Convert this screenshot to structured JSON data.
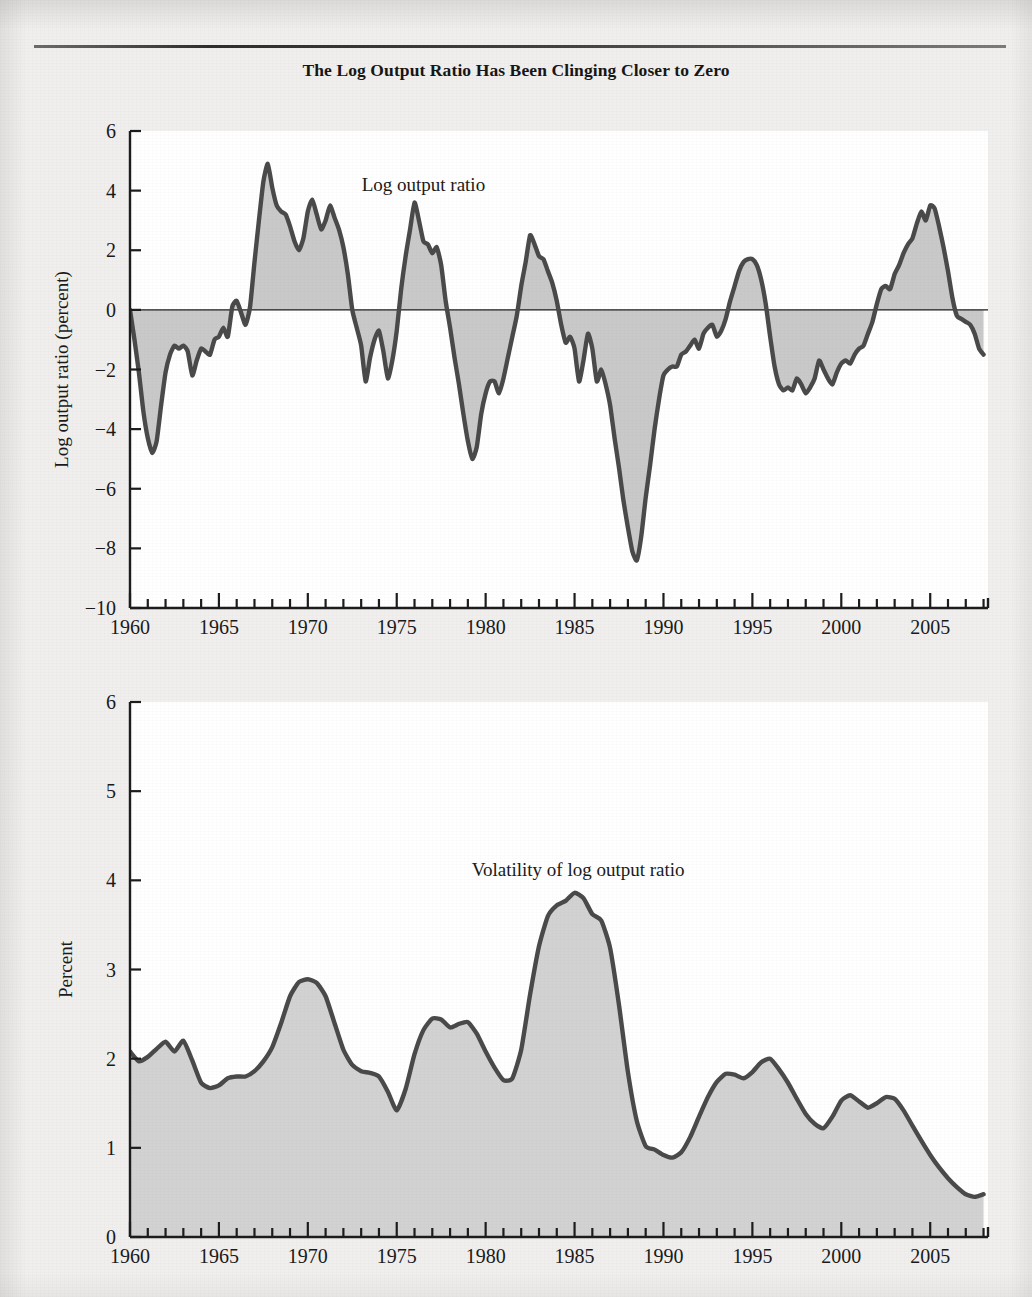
{
  "title": "The Log Output Ratio Has Been Clinging Closer to Zero",
  "page": {
    "background_color": "#f0efee",
    "plot_background_color": "#ffffff",
    "rule_color": "#3a3836"
  },
  "chart_data": [
    {
      "id": "log-output-ratio",
      "type": "area",
      "title": "The Log Output Ratio Has Been Clinging Closer to Zero",
      "series_label": "Log output ratio",
      "xlabel": "",
      "ylabel": "Log output ratio (percent)",
      "xlim": [
        1960,
        2008.25
      ],
      "ylim": [
        -10,
        6
      ],
      "yticks": [
        -10,
        -8,
        -6,
        -4,
        -2,
        0,
        2,
        4,
        6
      ],
      "ytick_labels": [
        "-10",
        "-8",
        "-6",
        "-4",
        "-2",
        "0",
        "2",
        "4",
        "6"
      ],
      "xticks": [
        1960,
        1965,
        1970,
        1975,
        1980,
        1985,
        1990,
        1995,
        2000,
        2005
      ],
      "xtick_labels": [
        "1960",
        "1965",
        "1970",
        "1975",
        "1980",
        "1985",
        "1990",
        "1995",
        "2000",
        "2005"
      ],
      "minor_xtick_interval": 1,
      "grid": false,
      "legend": "none",
      "zero_line": true,
      "line_color": "#4a4a4a",
      "fill_color": "#c9c9c9",
      "baseline": 0,
      "x": [
        1960.0,
        1960.25,
        1960.5,
        1960.75,
        1961.0,
        1961.25,
        1961.5,
        1961.75,
        1962.0,
        1962.25,
        1962.5,
        1962.75,
        1963.0,
        1963.25,
        1963.5,
        1963.75,
        1964.0,
        1964.25,
        1964.5,
        1964.75,
        1965.0,
        1965.25,
        1965.5,
        1965.75,
        1966.0,
        1966.25,
        1966.5,
        1966.75,
        1967.0,
        1967.25,
        1967.5,
        1967.75,
        1968.0,
        1968.25,
        1968.5,
        1968.75,
        1969.0,
        1969.25,
        1969.5,
        1969.75,
        1970.0,
        1970.25,
        1970.5,
        1970.75,
        1971.0,
        1971.25,
        1971.5,
        1971.75,
        1972.0,
        1972.25,
        1972.5,
        1972.75,
        1973.0,
        1973.25,
        1973.5,
        1973.75,
        1974.0,
        1974.25,
        1974.5,
        1974.75,
        1975.0,
        1975.25,
        1975.5,
        1975.75,
        1976.0,
        1976.25,
        1976.5,
        1976.75,
        1977.0,
        1977.25,
        1977.5,
        1977.75,
        1978.0,
        1978.25,
        1978.5,
        1978.75,
        1979.0,
        1979.25,
        1979.5,
        1979.75,
        1980.0,
        1980.25,
        1980.5,
        1980.75,
        1981.0,
        1981.25,
        1981.5,
        1981.75,
        1982.0,
        1982.25,
        1982.5,
        1982.75,
        1983.0,
        1983.25,
        1983.5,
        1983.75,
        1984.0,
        1984.25,
        1984.5,
        1984.75,
        1985.0,
        1985.25,
        1985.5,
        1985.75,
        1986.0,
        1986.25,
        1986.5,
        1986.75,
        1987.0,
        1987.25,
        1987.5,
        1987.75,
        1988.0,
        1988.25,
        1988.5,
        1988.75,
        1989.0,
        1989.25,
        1989.5,
        1989.75,
        1990.0,
        1990.25,
        1990.5,
        1990.75,
        1991.0,
        1991.25,
        1991.5,
        1991.75,
        1992.0,
        1992.25,
        1992.5,
        1992.75,
        1993.0,
        1993.25,
        1993.5,
        1993.75,
        1994.0,
        1994.25,
        1994.5,
        1994.75,
        1995.0,
        1995.25,
        1995.5,
        1995.75,
        1996.0,
        1996.25,
        1996.5,
        1996.75,
        1997.0,
        1997.25,
        1997.5,
        1997.75,
        1998.0,
        1998.25,
        1998.5,
        1998.75,
        1999.0,
        1999.25,
        1999.5,
        1999.75,
        2000.0,
        2000.25,
        2000.5,
        2000.75,
        2001.0,
        2001.25,
        2001.5,
        2001.75,
        2002.0,
        2002.25,
        2002.5,
        2002.75,
        2003.0,
        2003.25,
        2003.5,
        2003.75,
        2004.0,
        2004.25,
        2004.5,
        2004.75,
        2005.0,
        2005.25,
        2005.5,
        2005.75,
        2006.0,
        2006.25,
        2006.5,
        2006.75,
        2007.0,
        2007.25,
        2007.5,
        2007.75,
        2008.0
      ],
      "y": [
        0.0,
        -1.0,
        -2.1,
        -3.4,
        -4.3,
        -4.8,
        -4.4,
        -3.2,
        -2.1,
        -1.5,
        -1.2,
        -1.3,
        -1.2,
        -1.4,
        -2.2,
        -1.7,
        -1.3,
        -1.4,
        -1.5,
        -1.0,
        -0.9,
        -0.6,
        -0.9,
        0.1,
        0.3,
        -0.1,
        -0.5,
        0.1,
        1.6,
        3.0,
        4.3,
        4.9,
        4.1,
        3.5,
        3.3,
        3.2,
        2.8,
        2.3,
        2.0,
        2.4,
        3.3,
        3.7,
        3.2,
        2.7,
        3.0,
        3.5,
        3.1,
        2.7,
        2.1,
        1.2,
        0.0,
        -0.6,
        -1.2,
        -2.4,
        -1.6,
        -1.0,
        -0.7,
        -1.4,
        -2.3,
        -1.7,
        -0.7,
        0.7,
        1.8,
        2.7,
        3.6,
        3.0,
        2.3,
        2.2,
        1.9,
        2.1,
        1.5,
        0.3,
        -0.6,
        -1.6,
        -2.5,
        -3.5,
        -4.4,
        -5.0,
        -4.6,
        -3.5,
        -2.8,
        -2.4,
        -2.4,
        -2.8,
        -2.3,
        -1.6,
        -0.9,
        -0.2,
        0.8,
        1.6,
        2.5,
        2.2,
        1.8,
        1.7,
        1.3,
        0.9,
        0.3,
        -0.5,
        -1.1,
        -0.9,
        -1.3,
        -2.4,
        -1.7,
        -0.8,
        -1.3,
        -2.4,
        -2.0,
        -2.5,
        -3.2,
        -4.3,
        -5.3,
        -6.4,
        -7.3,
        -8.1,
        -8.4,
        -7.6,
        -6.3,
        -5.2,
        -4.0,
        -3.0,
        -2.2,
        -2.0,
        -1.9,
        -1.9,
        -1.5,
        -1.4,
        -1.2,
        -1.0,
        -1.3,
        -0.8,
        -0.6,
        -0.5,
        -0.9,
        -0.7,
        -0.3,
        0.3,
        0.8,
        1.3,
        1.6,
        1.7,
        1.7,
        1.5,
        1.0,
        0.2,
        -0.9,
        -1.9,
        -2.5,
        -2.7,
        -2.6,
        -2.7,
        -2.3,
        -2.5,
        -2.8,
        -2.6,
        -2.3,
        -1.7,
        -2.0,
        -2.3,
        -2.5,
        -2.1,
        -1.8,
        -1.7,
        -1.8,
        -1.5,
        -1.3,
        -1.2,
        -0.8,
        -0.4,
        0.2,
        0.7,
        0.8,
        0.7,
        1.2,
        1.5,
        1.9,
        2.2,
        2.4,
        2.9,
        3.3,
        3.0,
        3.5,
        3.4,
        2.8,
        2.1,
        1.3,
        0.4,
        -0.2,
        -0.3,
        -0.4,
        -0.5,
        -0.8,
        -1.3,
        -1.5,
        -1.3,
        -0.9,
        -0.5,
        -0.3,
        -0.2,
        0.1,
        0.4,
        0.2,
        0.6,
        0.7,
        0.5,
        0.2,
        -0.3,
        0.0,
        0.5,
        0.2,
        -0.4,
        -0.1,
        0.2,
        -0.3
      ],
      "annotation": {
        "text": "Log output ratio",
        "x": 1976.5,
        "y": 4.0
      }
    },
    {
      "id": "volatility-of-log-output-ratio",
      "type": "area",
      "title": "",
      "series_label": "Volatility of log output ratio",
      "xlabel": "",
      "ylabel": "Percent",
      "xlim": [
        1960,
        2008.25
      ],
      "ylim": [
        0,
        6
      ],
      "yticks": [
        0,
        1,
        2,
        3,
        4,
        5,
        6
      ],
      "ytick_labels": [
        "0",
        "1",
        "2",
        "3",
        "4",
        "5",
        "6"
      ],
      "xticks": [
        1960,
        1965,
        1970,
        1975,
        1980,
        1985,
        1990,
        1995,
        2000,
        2005
      ],
      "xtick_labels": [
        "1960",
        "1965",
        "1970",
        "1975",
        "1980",
        "1985",
        "1990",
        "1995",
        "2000",
        "2005"
      ],
      "minor_xtick_interval": 1,
      "grid": false,
      "legend": "none",
      "zero_line": false,
      "line_color": "#4a4a4a",
      "fill_color": "#d2d2d2",
      "baseline": 0,
      "x": [
        1960.0,
        1960.5,
        1961.0,
        1961.5,
        1962.0,
        1962.5,
        1963.0,
        1963.5,
        1964.0,
        1964.5,
        1965.0,
        1965.5,
        1966.0,
        1966.5,
        1967.0,
        1967.5,
        1968.0,
        1968.5,
        1969.0,
        1969.5,
        1970.0,
        1970.5,
        1971.0,
        1971.5,
        1972.0,
        1972.5,
        1973.0,
        1973.5,
        1974.0,
        1974.5,
        1975.0,
        1975.5,
        1976.0,
        1976.5,
        1977.0,
        1977.5,
        1978.0,
        1978.5,
        1979.0,
        1979.5,
        1980.0,
        1980.5,
        1981.0,
        1981.5,
        1982.0,
        1982.5,
        1983.0,
        1983.5,
        1984.0,
        1984.5,
        1985.0,
        1985.5,
        1986.0,
        1986.5,
        1987.0,
        1987.5,
        1988.0,
        1988.5,
        1989.0,
        1989.5,
        1990.0,
        1990.5,
        1991.0,
        1991.5,
        1992.0,
        1992.5,
        1993.0,
        1993.5,
        1994.0,
        1994.5,
        1995.0,
        1995.5,
        1996.0,
        1996.5,
        1997.0,
        1997.5,
        1998.0,
        1998.5,
        1999.0,
        1999.5,
        2000.0,
        2000.5,
        2001.0,
        2001.5,
        2002.0,
        2002.5,
        2003.0,
        2003.5,
        2004.0,
        2004.5,
        2005.0,
        2005.5,
        2006.0,
        2006.5,
        2007.0,
        2007.5,
        2008.0
      ],
      "y": [
        2.08,
        1.97,
        2.02,
        2.11,
        2.19,
        2.08,
        2.2,
        1.98,
        1.73,
        1.67,
        1.7,
        1.78,
        1.8,
        1.8,
        1.86,
        1.97,
        2.13,
        2.4,
        2.7,
        2.86,
        2.89,
        2.85,
        2.7,
        2.4,
        2.1,
        1.93,
        1.86,
        1.84,
        1.8,
        1.63,
        1.42,
        1.66,
        2.05,
        2.32,
        2.45,
        2.44,
        2.35,
        2.39,
        2.41,
        2.28,
        2.08,
        1.9,
        1.76,
        1.78,
        2.1,
        2.72,
        3.26,
        3.6,
        3.72,
        3.77,
        3.86,
        3.8,
        3.62,
        3.55,
        3.24,
        2.6,
        1.85,
        1.3,
        1.02,
        0.98,
        0.92,
        0.89,
        0.95,
        1.12,
        1.35,
        1.57,
        1.74,
        1.83,
        1.82,
        1.78,
        1.85,
        1.96,
        2.0,
        1.88,
        1.73,
        1.55,
        1.38,
        1.27,
        1.22,
        1.35,
        1.53,
        1.59,
        1.52,
        1.45,
        1.5,
        1.57,
        1.55,
        1.42,
        1.25,
        1.08,
        0.92,
        0.78,
        0.66,
        0.56,
        0.48,
        0.45,
        0.48
      ],
      "annotation": {
        "text": "Volatility of log output ratio",
        "x": 1985.2,
        "y": 4.05
      }
    }
  ]
}
